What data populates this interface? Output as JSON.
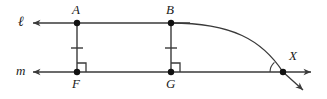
{
  "figure": {
    "background_color": "#ffffff",
    "stroke_color": "#3a3a3a",
    "point_color": "#111111",
    "label_color": "#1a1a1a"
  },
  "labels": {
    "line_l": "ℓ",
    "line_m": "m",
    "point_a": "A",
    "point_b": "B",
    "point_f": "F",
    "point_g": "G",
    "point_x": "X"
  },
  "geometry": {
    "line_l_y": 23,
    "line_m_y": 72,
    "line_left_arrow_x": 32,
    "line_l_right_x": 190,
    "line_m_right_arrow_x": 311,
    "point_a": {
      "x": 77,
      "y": 23
    },
    "point_b": {
      "x": 171,
      "y": 23
    },
    "point_f": {
      "x": 77,
      "y": 72
    },
    "point_g": {
      "x": 171,
      "y": 72
    },
    "point_x": {
      "x": 283,
      "y": 72
    },
    "tick_af_y": 48,
    "tick_bg_y": 48,
    "tick_half_width": 6,
    "right_angle_size": 9,
    "curve_start": {
      "x": 171,
      "y": 23
    },
    "curve_control_1": {
      "x": 232,
      "y": 23
    },
    "curve_control_2": {
      "x": 262,
      "y": 40
    },
    "curve_end": {
      "x": 283,
      "y": 72
    },
    "tangent_ray_end": {
      "x": 303,
      "y": 90
    },
    "angle_arc_radius": 13,
    "point_radius": 3.2
  },
  "label_positions": {
    "line_l": {
      "x": 18,
      "y": 15
    },
    "line_m": {
      "x": 16,
      "y": 64
    },
    "point_a": {
      "x": 72,
      "y": 3
    },
    "point_b": {
      "x": 166,
      "y": 3
    },
    "point_f": {
      "x": 72,
      "y": 77
    },
    "point_g": {
      "x": 166,
      "y": 77
    },
    "point_x": {
      "x": 289,
      "y": 49
    }
  }
}
